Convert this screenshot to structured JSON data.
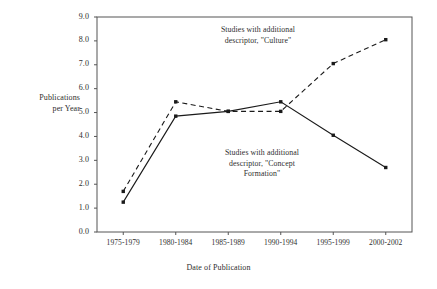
{
  "chart_data": {
    "type": "line",
    "title": "",
    "xlabel": "Date of Publication",
    "ylabel": "Publications per Year",
    "ylabel_lines": [
      "Publications",
      "per Year"
    ],
    "categories": [
      "1975-1979",
      "1980-1984",
      "1985-1989",
      "1990-1994",
      "1995-1999",
      "2000-2002"
    ],
    "yticks": [
      "0.0",
      "1.0",
      "2.0",
      "3.0",
      "4.0",
      "5.0",
      "6.0",
      "7.0",
      "8.0",
      "9.0"
    ],
    "ylim": [
      0.0,
      9.0
    ],
    "ytick_step": 1.0,
    "grid": false,
    "legend": "none",
    "annotations_as_labels": true,
    "series": [
      {
        "name": "Studies with additional descriptor, \"Culture\"",
        "style": "dashed",
        "marker": "filled-square",
        "color": "#1a1a1a",
        "values": [
          1.7,
          5.45,
          5.05,
          5.05,
          7.05,
          8.05
        ]
      },
      {
        "name": "Studies with additional descriptor, \"Concept Formation\"",
        "style": "solid",
        "marker": "filled-square",
        "color": "#1a1a1a",
        "values": [
          1.25,
          4.85,
          5.05,
          5.45,
          4.05,
          2.7
        ]
      }
    ],
    "annotations": [
      {
        "id": "culture",
        "lines": [
          "Studies with additional",
          "descriptor, \"Culture\""
        ],
        "target_series": "Studies with additional descriptor, \"Culture\""
      },
      {
        "id": "concept",
        "lines": [
          "Studies with additional",
          "descriptor, \"Concept",
          "Formation\""
        ],
        "target_series": "Studies with additional descriptor, \"Concept Formation\""
      }
    ]
  },
  "axis": {
    "frame_color": "#555555",
    "background": "#ffffff"
  }
}
